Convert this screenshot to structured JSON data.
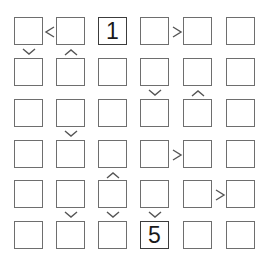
{
  "puzzle": {
    "type": "Futoshiki",
    "size": 6,
    "grid": [
      [
        "",
        "",
        "1",
        "",
        "",
        ""
      ],
      [
        "",
        "",
        "",
        "",
        "",
        ""
      ],
      [
        "",
        "",
        "",
        "",
        "",
        ""
      ],
      [
        "",
        "",
        "",
        "",
        "",
        ""
      ],
      [
        "",
        "",
        "",
        "",
        "",
        ""
      ],
      [
        "",
        "",
        "",
        "5",
        "",
        ""
      ]
    ],
    "givens": [
      {
        "row": 0,
        "col": 2,
        "value": "1"
      },
      {
        "row": 5,
        "col": 3,
        "value": "5"
      }
    ],
    "horizontal_constraints": [
      {
        "row": 0,
        "col": 0,
        "sign": "<"
      },
      {
        "row": 0,
        "col": 3,
        "sign": ">"
      },
      {
        "row": 3,
        "col": 3,
        "sign": ">"
      },
      {
        "row": 4,
        "col": 4,
        "sign": ">"
      }
    ],
    "vertical_constraints": [
      {
        "row": 0,
        "col": 0,
        "sign": "v"
      },
      {
        "row": 0,
        "col": 1,
        "sign": "^"
      },
      {
        "row": 1,
        "col": 3,
        "sign": "v"
      },
      {
        "row": 1,
        "col": 4,
        "sign": "^"
      },
      {
        "row": 2,
        "col": 1,
        "sign": "v"
      },
      {
        "row": 3,
        "col": 2,
        "sign": "^"
      },
      {
        "row": 4,
        "col": 1,
        "sign": "v"
      },
      {
        "row": 4,
        "col": 2,
        "sign": "v"
      },
      {
        "row": 4,
        "col": 3,
        "sign": "v"
      }
    ]
  },
  "colors": {
    "cell_border": "#6e6e6e",
    "given_border": "#3c3c3c",
    "sign": "#555555",
    "digit": "#1a1a1a",
    "background": "#ffffff"
  },
  "layout": {
    "col_x": [
      14,
      56,
      98,
      140,
      183,
      226
    ],
    "row_y": [
      17,
      58,
      99,
      140,
      180,
      221
    ],
    "cell_w": 27,
    "cell_h": 26
  }
}
